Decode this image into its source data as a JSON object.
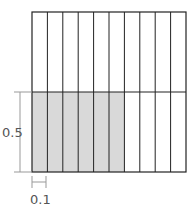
{
  "diagram": {
    "columns": 10,
    "rows": 2,
    "shaded_row": "bottom",
    "shaded_columns": 6,
    "shade_color": "#d9d9d9",
    "line_color": "#222222",
    "dimension_color": "#888888",
    "height_label": "0.5",
    "width_label": "0.1"
  }
}
